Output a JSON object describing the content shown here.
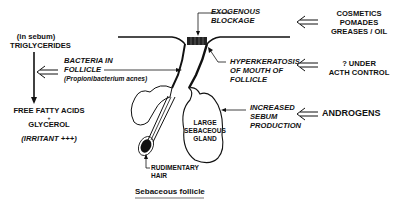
{
  "diagram": {
    "caption": "Sebaceous follicle",
    "left": {
      "sebum_note": "(in sebum)",
      "triglycerides": "TRIGLYCERIDES",
      "ffa": "FREE FATTY ACIDS",
      "plus": "+",
      "glycerol": "GLYCEROL",
      "irritant": "(IRRITANT +++)"
    },
    "labels": {
      "bacteria_line1": "BACTERIA IN",
      "bacteria_line2": "FOLLICLE",
      "bacteria_species": "(Propionibacterium acnes)",
      "exogenous_line1": "EXOGENOUS",
      "exogenous_line2": "BLOCKAGE",
      "hyper_line1": "HYPERKERATOSIS",
      "hyper_line2": "OF MOUTH OF",
      "hyper_line3": "FOLLICLE",
      "sebum_line1": "INCREASED",
      "sebum_line2": "SEBUM",
      "sebum_line3": "PRODUCTION",
      "gland_line1": "LARGE",
      "gland_line2": "SEBACEOUS",
      "gland_line3": "GLAND",
      "hair_line1": "RUDIMENTARY",
      "hair_line2": "HAIR"
    },
    "causes": {
      "cosmetics_line1": "COSMETICS",
      "cosmetics_line2": "POMADES",
      "cosmetics_line3": "GREASES / OIL",
      "acth_line1": "? UNDER",
      "acth_line2": "ACTH CONTROL",
      "androgens": "ANDROGENS"
    }
  }
}
